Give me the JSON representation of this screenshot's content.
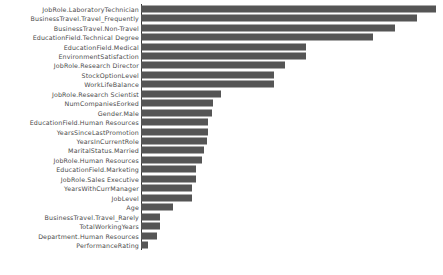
{
  "chart_data": {
    "type": "bar",
    "orientation": "horizontal",
    "title": "",
    "xlabel": "",
    "ylabel": "",
    "grid": false,
    "legend": null,
    "bar_color": "#555555",
    "axis_color": "#3a3a3a",
    "background": "#ffffff",
    "xlim": [
      0,
      1.0
    ],
    "categories": [
      "JobRole.LaboratoryTechnician",
      "BusinessTravel.Travel_Frequently",
      "BusinessTravel.Non-Travel",
      "EducationField.Technical Degree",
      "EducationField.Medical",
      "EnvironmentSatisfaction",
      "JobRole.Research Director",
      "StockOptionLevel",
      "WorkLifeBalance",
      "JobRole.Research Scientist",
      "NumCompaniesEorked",
      "Gender.Male",
      "EducationField.Human Resources",
      "YearsSinceLastPromotion",
      "YearsInCurrentRole",
      "MaritalStatus.Married",
      "JobRole.Human Resources",
      "EducationField.Marketing",
      "JobRole.Sales Executive",
      "YearsWithCurrManager",
      "JobLevel",
      "Age",
      "BusinessTravel.Travel_Rarely",
      "TotalWorkingYears",
      "Department.Human Resources",
      "PerformanceRating"
    ],
    "values": [
      1.0,
      0.935,
      0.86,
      0.785,
      0.558,
      0.558,
      0.487,
      0.452,
      0.452,
      0.272,
      0.245,
      0.242,
      0.228,
      0.228,
      0.225,
      0.215,
      0.208,
      0.188,
      0.188,
      0.174,
      0.174,
      0.11,
      0.064,
      0.064,
      0.053,
      0.024
    ]
  }
}
